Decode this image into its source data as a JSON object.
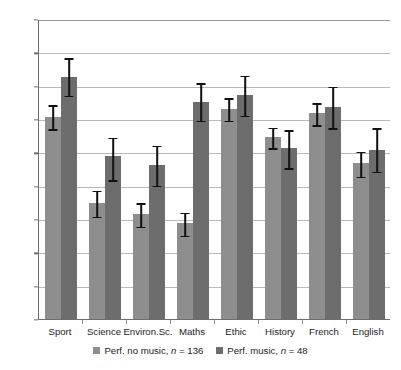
{
  "chart_data": {
    "type": "bar",
    "title": "",
    "subtitle": "",
    "xlabel": "",
    "ylabel": "",
    "ylim": [
      70.0,
      88.0
    ],
    "ytick_step": 2.0,
    "ytick_labels": [
      "88.0",
      "86.0",
      "84.0",
      "82.0",
      "80.0",
      "78.0",
      "76.0",
      "74.0",
      "72.0",
      "70.0"
    ],
    "ytick_values": [
      88.0,
      86.0,
      84.0,
      82.0,
      80.0,
      78.0,
      76.0,
      74.0,
      72.0,
      70.0
    ],
    "grid": true,
    "grid_axis": "y",
    "legend_position": "bottom",
    "error_bars": "confidence-interval",
    "categories": [
      "Sport",
      "Science",
      "Environ.Sc.",
      "Maths",
      "Ethic",
      "History",
      "French",
      "English"
    ],
    "series": [
      {
        "name": "Perf. no music, n = 136",
        "color": "#8e8e8e",
        "values": [
          82.15,
          76.95,
          76.3,
          75.75,
          82.6,
          80.9,
          82.35,
          79.35
        ],
        "err_low": [
          81.45,
          76.2,
          75.6,
          75.05,
          81.95,
          80.3,
          81.7,
          78.6
        ],
        "err_high": [
          82.9,
          77.75,
          77.0,
          76.45,
          83.3,
          81.55,
          83.0,
          80.1
        ]
      },
      {
        "name": "Perf. music, n = 48",
        "color": "#6d6d6d",
        "values": [
          84.55,
          79.8,
          79.25,
          83.05,
          83.45,
          80.25,
          82.75,
          80.15
        ],
        "err_low": [
          83.45,
          78.4,
          78.05,
          81.95,
          82.25,
          79.1,
          81.5,
          78.9
        ],
        "err_high": [
          85.7,
          80.95,
          80.45,
          84.2,
          84.65,
          81.4,
          84.0,
          81.5
        ]
      }
    ]
  },
  "legend": {
    "entries": [
      {
        "label_prefix": "Perf. no music, ",
        "label_italic": "n",
        "label_suffix": " = 136"
      },
      {
        "label_prefix": "Perf. music, ",
        "label_italic": "n",
        "label_suffix": " = 48"
      }
    ]
  }
}
